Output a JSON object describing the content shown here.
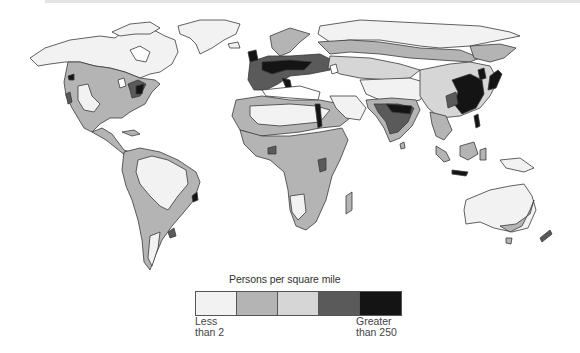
{
  "legend": {
    "title": "Persons per square mile",
    "low_label_line1": "Less",
    "low_label_line2": "than 2",
    "high_label_line1": "Greater",
    "high_label_line2": "than 250",
    "classes": [
      {
        "index": 1,
        "color": "#f2f2f2",
        "meaning": "Less than 2"
      },
      {
        "index": 2,
        "color": "#b4b4b4",
        "meaning": "low-moderate"
      },
      {
        "index": 3,
        "color": "#d6d6d6",
        "meaning": "moderate"
      },
      {
        "index": 4,
        "color": "#5a5a5a",
        "meaning": "high"
      },
      {
        "index": 5,
        "color": "#141414",
        "meaning": "Greater than 250"
      }
    ]
  },
  "colors": {
    "sparse": "#f2f2f2",
    "low": "#b4b4b4",
    "mid": "#d6d6d6",
    "high": "#5a5a5a",
    "highest": "#141414",
    "outline": "#3a3a3a",
    "ocean": "#ffffff"
  },
  "regions": [
    {
      "name": "North America",
      "dominant": "sparse north, low-moderate south, dense northeast"
    },
    {
      "name": "Greenland",
      "dominant": "sparse"
    },
    {
      "name": "South America",
      "dominant": "sparse interior, low coastal"
    },
    {
      "name": "Europe",
      "dominant": "high to highest"
    },
    {
      "name": "Africa",
      "dominant": "sparse Sahara, low sub-Saharan, dense Nile"
    },
    {
      "name": "Asia",
      "dominant": "sparse north/central, highest India/China/Japan"
    },
    {
      "name": "Australia",
      "dominant": "sparse, low southeast coast"
    }
  ]
}
